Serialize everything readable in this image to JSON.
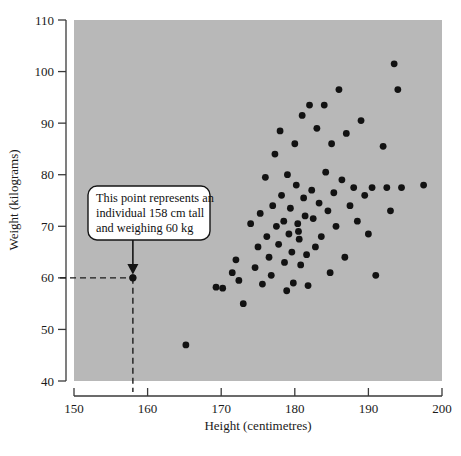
{
  "chart_data": {
    "type": "scatter",
    "title": "",
    "xlabel": "Height (centimetres)",
    "ylabel": "Weight (kilograms)",
    "xlim": [
      150,
      200
    ],
    "ylim": [
      40,
      110
    ],
    "xticks": [
      150,
      160,
      170,
      180,
      190,
      200
    ],
    "yticks": [
      40,
      50,
      60,
      70,
      80,
      90,
      100,
      110
    ],
    "grid": false,
    "legend": null,
    "plot_background_color": "#b8b8b8",
    "marker_color": "#121212",
    "annotation": {
      "text_lines": [
        "This point represents an",
        "individual 158 cm tall",
        "and weighing 60 kg"
      ],
      "points_to": {
        "x": 158,
        "y": 60
      },
      "guide_lines": "dashed lines from y-axis at 60 and down to x-axis at 158"
    },
    "points": [
      [
        158.0,
        60.0
      ],
      [
        165.2,
        47.0
      ],
      [
        169.3,
        58.2
      ],
      [
        170.2,
        58.0
      ],
      [
        171.5,
        61.0
      ],
      [
        172.0,
        63.5
      ],
      [
        172.4,
        59.5
      ],
      [
        173.0,
        55.0
      ],
      [
        174.0,
        70.5
      ],
      [
        174.6,
        62.0
      ],
      [
        175.0,
        66.0
      ],
      [
        175.3,
        72.5
      ],
      [
        175.6,
        58.8
      ],
      [
        176.0,
        79.5
      ],
      [
        176.2,
        68.0
      ],
      [
        176.5,
        64.0
      ],
      [
        176.8,
        60.5
      ],
      [
        177.0,
        74.0
      ],
      [
        177.3,
        84.0
      ],
      [
        177.5,
        70.0
      ],
      [
        177.8,
        66.5
      ],
      [
        178.0,
        88.5
      ],
      [
        178.2,
        76.0
      ],
      [
        178.5,
        71.0
      ],
      [
        178.6,
        63.0
      ],
      [
        178.9,
        57.5
      ],
      [
        179.0,
        80.0
      ],
      [
        179.2,
        68.5
      ],
      [
        179.4,
        73.5
      ],
      [
        179.6,
        65.0
      ],
      [
        179.8,
        59.0
      ],
      [
        180.0,
        86.0
      ],
      [
        180.2,
        78.0
      ],
      [
        180.4,
        70.5
      ],
      [
        180.5,
        69.0
      ],
      [
        180.6,
        67.5
      ],
      [
        180.8,
        62.5
      ],
      [
        181.0,
        91.5
      ],
      [
        181.2,
        75.5
      ],
      [
        181.4,
        72.0
      ],
      [
        181.6,
        64.5
      ],
      [
        181.8,
        58.5
      ],
      [
        182.0,
        93.5
      ],
      [
        182.3,
        77.0
      ],
      [
        182.5,
        71.5
      ],
      [
        182.8,
        66.0
      ],
      [
        183.0,
        89.0
      ],
      [
        183.3,
        74.5
      ],
      [
        183.6,
        68.0
      ],
      [
        184.0,
        93.5
      ],
      [
        184.2,
        80.5
      ],
      [
        184.5,
        73.0
      ],
      [
        184.8,
        61.0
      ],
      [
        185.0,
        86.0
      ],
      [
        185.3,
        76.5
      ],
      [
        185.6,
        70.0
      ],
      [
        186.0,
        96.5
      ],
      [
        186.4,
        79.0
      ],
      [
        186.8,
        64.0
      ],
      [
        187.0,
        88.0
      ],
      [
        187.5,
        74.0
      ],
      [
        188.0,
        77.5
      ],
      [
        188.5,
        71.0
      ],
      [
        189.0,
        90.5
      ],
      [
        189.5,
        76.0
      ],
      [
        190.0,
        68.5
      ],
      [
        190.5,
        77.5
      ],
      [
        191.0,
        60.5
      ],
      [
        192.0,
        85.5
      ],
      [
        192.5,
        77.5
      ],
      [
        193.0,
        73.0
      ],
      [
        193.5,
        101.5
      ],
      [
        194.0,
        96.5
      ],
      [
        194.5,
        77.5
      ],
      [
        197.5,
        78.0
      ]
    ]
  },
  "axes": {
    "y_tick_labels": [
      "110",
      "100",
      "90",
      "80",
      "70",
      "60",
      "50",
      "40"
    ],
    "x_tick_labels": [
      "150",
      "160",
      "170",
      "180",
      "190",
      "200"
    ],
    "x_title": "Height (centimetres)",
    "y_title": "Weight (kilograms)"
  },
  "callout": {
    "line1": "This point represents an",
    "line2": "individual 158 cm tall",
    "line3": "and weighing 60 kg"
  }
}
